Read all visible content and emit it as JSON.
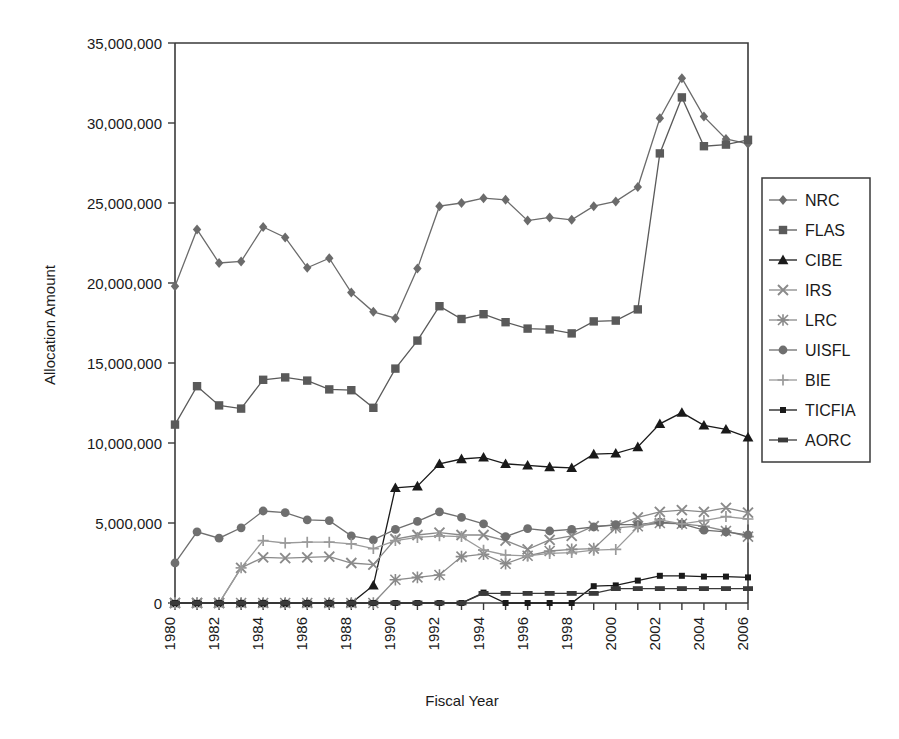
{
  "chart_data": {
    "type": "line",
    "title": "",
    "xlabel": "Fiscal Year",
    "ylabel": "Allocation Amount",
    "xlim": [
      1980,
      2006
    ],
    "ylim": [
      0,
      35000000
    ],
    "ytick_step": 5000000,
    "grid": false,
    "legend_position": "right",
    "ytick_labels": [
      "0",
      "5,000,000",
      "10,000,000",
      "15,000,000",
      "20,000,000",
      "25,000,000",
      "30,000,000",
      "35,000,000"
    ],
    "ytick_values": [
      0,
      5000000,
      10000000,
      15000000,
      20000000,
      25000000,
      30000000,
      35000000
    ],
    "categories": [
      1980,
      1981,
      1982,
      1983,
      1984,
      1985,
      1986,
      1987,
      1988,
      1989,
      1990,
      1991,
      1992,
      1993,
      1994,
      1995,
      1996,
      1997,
      1998,
      1999,
      2000,
      2001,
      2002,
      2003,
      2004,
      2005,
      2006
    ],
    "xtick_labels": [
      "1980",
      "",
      "1982",
      "",
      "1984",
      "",
      "1986",
      "",
      "1988",
      "",
      "1990",
      "",
      "1992",
      "",
      "1994",
      "",
      "1996",
      "",
      "1998",
      "",
      "2000",
      "",
      "2002",
      "",
      "2004",
      "",
      "2006"
    ],
    "series": [
      {
        "name": "NRC",
        "marker": "diamond",
        "color": "#6b6b6b",
        "values": [
          19800000,
          23350000,
          21250000,
          21350000,
          23500000,
          22850000,
          20950000,
          21550000,
          19400000,
          18200000,
          17800000,
          20900000,
          24800000,
          25000000,
          25300000,
          25200000,
          23900000,
          24100000,
          23950000,
          24800000,
          25100000,
          26000000,
          30300000,
          32800000,
          30400000,
          29000000,
          28700000
        ]
      },
      {
        "name": "FLAS",
        "marker": "square",
        "color": "#5a5a5a",
        "values": [
          11150000,
          13550000,
          12350000,
          12150000,
          13950000,
          14100000,
          13900000,
          13350000,
          13300000,
          12200000,
          14650000,
          16400000,
          18550000,
          17750000,
          18050000,
          17550000,
          17150000,
          17100000,
          16850000,
          17600000,
          17650000,
          18350000,
          28100000,
          31600000,
          28550000,
          28650000,
          28950000
        ]
      },
      {
        "name": "CIBE",
        "marker": "triangle",
        "color": "#1a1a1a",
        "values": [
          0,
          0,
          0,
          0,
          0,
          0,
          0,
          0,
          0,
          1100000,
          7200000,
          7300000,
          8700000,
          9000000,
          9100000,
          8700000,
          8600000,
          8500000,
          8450000,
          9300000,
          9350000,
          9750000,
          11200000,
          11900000,
          11100000,
          10850000,
          10350000
        ]
      },
      {
        "name": "IRS",
        "marker": "cross",
        "color": "#8a8a8a",
        "values": [
          0,
          0,
          0,
          2200000,
          2850000,
          2800000,
          2850000,
          2900000,
          2500000,
          2400000,
          4000000,
          4250000,
          4400000,
          4250000,
          4250000,
          3900000,
          3350000,
          3950000,
          4200000,
          4800000,
          4850000,
          5350000,
          5700000,
          5800000,
          5700000,
          5950000,
          5650000
        ]
      },
      {
        "name": "LRC",
        "marker": "star",
        "color": "#8a8a8a",
        "values": [
          0,
          0,
          0,
          0,
          0,
          0,
          0,
          0,
          0,
          0,
          1450000,
          1600000,
          1750000,
          2900000,
          3050000,
          2450000,
          2950000,
          3250000,
          3350000,
          3400000,
          4700000,
          4800000,
          5000000,
          4950000,
          4800000,
          4500000,
          4150000
        ]
      },
      {
        "name": "UISFL",
        "marker": "circle",
        "color": "#6f6f6f",
        "values": [
          2500000,
          4450000,
          4050000,
          4700000,
          5750000,
          5650000,
          5200000,
          5150000,
          4200000,
          3950000,
          4600000,
          5100000,
          5700000,
          5350000,
          4950000,
          4150000,
          4650000,
          4500000,
          4600000,
          4750000,
          4900000,
          4900000,
          5050000,
          4950000,
          4550000,
          4450000,
          4250000
        ]
      },
      {
        "name": "BIE",
        "marker": "plus",
        "color": "#9a9a9a",
        "values": [
          0,
          0,
          0,
          2200000,
          3900000,
          3750000,
          3800000,
          3800000,
          3700000,
          3400000,
          3900000,
          4100000,
          4200000,
          4150000,
          3300000,
          3000000,
          2950000,
          3100000,
          3150000,
          3300000,
          3350000,
          4750000,
          5200000,
          4950000,
          5150000,
          5400000,
          5250000
        ]
      },
      {
        "name": "TICFIA",
        "marker": "smallsquare",
        "color": "#1a1a1a",
        "values": [
          0,
          0,
          0,
          0,
          0,
          0,
          0,
          0,
          0,
          0,
          0,
          0,
          0,
          0,
          650000,
          0,
          0,
          0,
          0,
          1050000,
          1100000,
          1400000,
          1700000,
          1700000,
          1650000,
          1650000,
          1600000
        ]
      },
      {
        "name": "AORC",
        "marker": "dashsquare",
        "color": "#3a3a3a",
        "values": [
          0,
          0,
          0,
          0,
          0,
          0,
          0,
          0,
          0,
          0,
          0,
          0,
          0,
          0,
          600000,
          600000,
          600000,
          600000,
          600000,
          600000,
          900000,
          900000,
          900000,
          900000,
          900000,
          900000,
          900000
        ]
      }
    ]
  },
  "legend": {
    "items": [
      {
        "label": "NRC"
      },
      {
        "label": "FLAS"
      },
      {
        "label": "CIBE"
      },
      {
        "label": "IRS"
      },
      {
        "label": "LRC"
      },
      {
        "label": "UISFL"
      },
      {
        "label": "BIE"
      },
      {
        "label": "TICFIA"
      },
      {
        "label": "AORC"
      }
    ]
  }
}
